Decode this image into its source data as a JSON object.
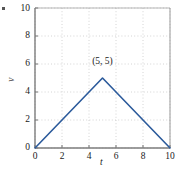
{
  "chart_data": {
    "type": "line",
    "title": "",
    "subtitle": "",
    "xlabel": "t",
    "ylabel": "v",
    "xlim": [
      0,
      10
    ],
    "ylim": [
      0,
      10
    ],
    "xticks": [
      0,
      2,
      4,
      6,
      8,
      10
    ],
    "yticks": [
      0,
      2,
      4,
      6,
      8,
      10
    ],
    "xtick_labels": [
      "0",
      "2",
      "4",
      "6",
      "8",
      "10"
    ],
    "ytick_labels": [
      "0",
      "2",
      "4",
      "6",
      "8",
      "10"
    ],
    "grid": true,
    "grid_style": "dotted",
    "legend": false,
    "legend_position": "none",
    "series": [
      {
        "name": "v(t)",
        "x": [
          0,
          5,
          10
        ],
        "values": [
          0,
          5,
          0
        ],
        "color": "#2b5a9b"
      }
    ],
    "annotations": [
      {
        "label": "(5, 5)",
        "x": 5,
        "y": 5,
        "offset_x": 0,
        "offset_y": 1.1
      }
    ]
  },
  "style": {
    "line_color": "#2b5a9b",
    "grid_color": "#c9c9c9",
    "axis_color": "#7d7d7d",
    "text_color": "#1a1a1a",
    "background": "#ffffff"
  }
}
